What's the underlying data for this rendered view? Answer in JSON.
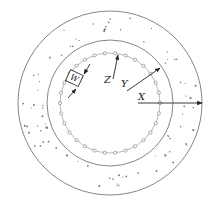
{
  "diagram": {
    "type": "concentric-circles",
    "center": [
      110,
      103
    ],
    "circles": [
      {
        "name": "outer-boundary",
        "r": 92
      },
      {
        "name": "middle-boundary",
        "r": 63
      },
      {
        "name": "inner-particle-ring",
        "r": 50,
        "markers": 30
      }
    ],
    "labels": {
      "w": "W",
      "z": "Z",
      "y": "Y",
      "x": "X"
    },
    "colors": {
      "line": "#555555",
      "arrow": "#222222",
      "marker": "#777777"
    }
  }
}
